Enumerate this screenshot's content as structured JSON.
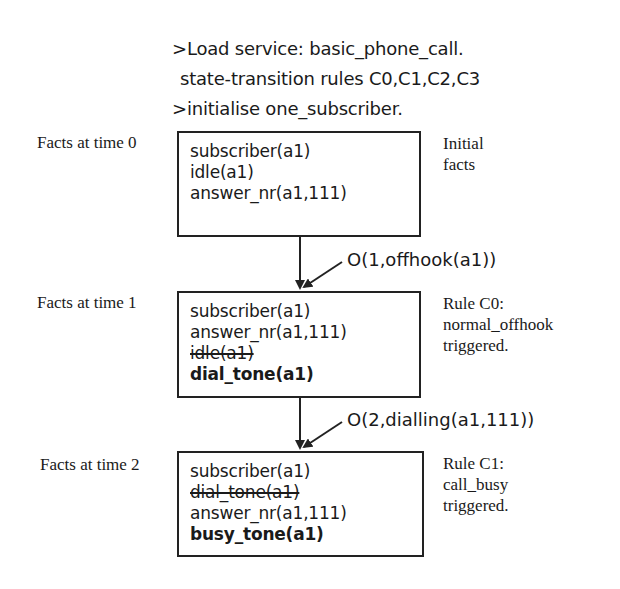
{
  "commands": [
    ">Load service: basic_phone_call.",
    "state-transition rules C0,C1,C2,C3",
    ">initialise one_subscriber."
  ],
  "states": [
    {
      "label": "Facts at time 0",
      "facts": [
        {
          "text": "subscriber(a1)",
          "status": "kept"
        },
        {
          "text": "idle(a1)",
          "status": "kept"
        },
        {
          "text": "answer_nr(a1,111)",
          "status": "kept"
        }
      ],
      "note": "Initial\nfacts"
    },
    {
      "label": "Facts at time 1",
      "facts": [
        {
          "text": "subscriber(a1)",
          "status": "kept"
        },
        {
          "text": "answer_nr(a1,111)",
          "status": "kept"
        },
        {
          "text": "idle(a1)",
          "status": "removed"
        },
        {
          "text": "dial_tone(a1)",
          "status": "added"
        }
      ],
      "note": "Rule C0:\nnormal_offhook\ntriggered."
    },
    {
      "label": "Facts at time 2",
      "facts": [
        {
          "text": "subscriber(a1)",
          "status": "kept"
        },
        {
          "text": "dial_tone(a1)",
          "status": "removed"
        },
        {
          "text": "answer_nr(a1,111)",
          "status": "kept"
        },
        {
          "text": "busy_tone(a1)",
          "status": "added"
        }
      ],
      "note": "Rule C1:\ncall_busy\ntriggered."
    }
  ],
  "events": [
    "O(1,offhook(a1))",
    "O(2,dialling(a1,111))"
  ]
}
